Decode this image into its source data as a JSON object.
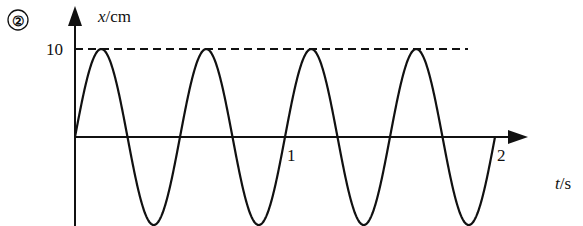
{
  "figure": {
    "number_label": "②"
  },
  "chart_data": {
    "type": "line",
    "title": "",
    "xlabel_var": "t",
    "xlabel_unit": "/s",
    "ylabel_var": "x",
    "ylabel_unit": "/cm",
    "x_ticks": [
      {
        "value": 1,
        "label": "1"
      },
      {
        "value": 2,
        "label": "2"
      }
    ],
    "y_ticks": [
      {
        "value": 10,
        "label": "10"
      }
    ],
    "xlim": [
      0,
      2
    ],
    "ylim": [
      -10,
      10
    ],
    "reference_line": {
      "y": 10,
      "style": "dashed"
    },
    "series": [
      {
        "name": "x(t)",
        "function": "10*sin(4*pi*t)",
        "amplitude": 10,
        "period": 0.5,
        "t_start": 0,
        "t_end": 2
      }
    ],
    "grid": false,
    "legend": "none"
  }
}
